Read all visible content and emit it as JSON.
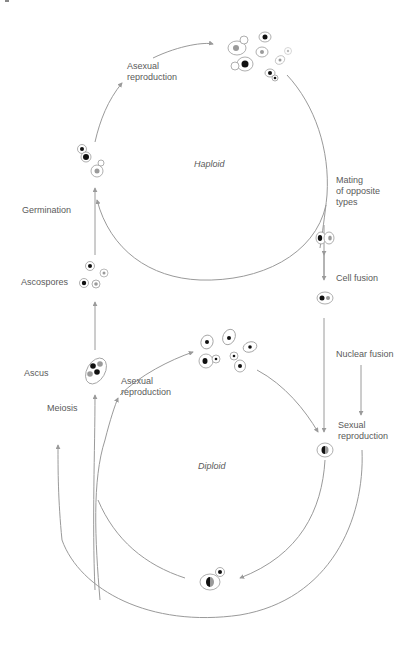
{
  "diagram": {
    "colors": {
      "line": "#9a9a9a",
      "text": "#5a5a5a",
      "nucleus_haploid_a": "#111111",
      "nucleus_haploid_b": "#9a9a9a"
    },
    "phases": {
      "haploid": "Haploid",
      "diploid": "Diploid"
    },
    "labels": {
      "asexual_top": "Asexual\nreproduction",
      "germination": "Germination",
      "ascospores": "Ascospores",
      "ascus": "Ascus",
      "meiosis": "Meiosis",
      "asexual_bottom": "Asexual\nreproduction",
      "mating": "Mating\nof opposite\ntypes",
      "cell_fusion": "Cell fusion",
      "nuclear_fusion": "Nuclear fusion",
      "sexual_reproduction": "Sexual\nreproduction"
    },
    "nodes": [
      {
        "id": "haploid-budding-cells",
        "label": "Haploid budding cells (asexual)"
      },
      {
        "id": "germinating-spores",
        "label": "Germinating spores"
      },
      {
        "id": "ascospores",
        "label": "Ascospores"
      },
      {
        "id": "ascus",
        "label": "Ascus with four spores"
      },
      {
        "id": "mating-pair",
        "label": "Mating pair"
      },
      {
        "id": "fused-cell",
        "label": "Fused cell (dikaryon)"
      },
      {
        "id": "diploid-zygote",
        "label": "Diploid zygote"
      },
      {
        "id": "diploid-budding-cells",
        "label": "Diploid budding cells (asexual)"
      },
      {
        "id": "diploid-budding-cell-bottom",
        "label": "Diploid budding cell"
      }
    ]
  }
}
